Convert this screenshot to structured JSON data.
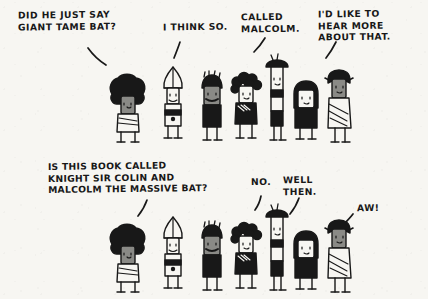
{
  "comic": {
    "title": "Knight Sir Colin and Malcolm the Massive Bat",
    "background_color": "#f7f6f2",
    "ink_color": "#181818",
    "panels": [
      {
        "id": "top-panel",
        "captions": [
          {
            "id": "caption-did-he-just-say",
            "text": "DID HE JUST SAY\nGIANT TAME BAT?",
            "x": 18,
            "y": 10
          },
          {
            "id": "caption-i-think-so",
            "text": "I THINK SO.",
            "x": 163,
            "y": 22
          },
          {
            "id": "caption-called-malcolm",
            "text": "CALLED\nMALCOLM.",
            "x": 241,
            "y": 12
          },
          {
            "id": "caption-id-like-to-hear",
            "text": "I'D LIKE TO\nHEAR MORE\nABOUT THAT.",
            "x": 318,
            "y": 9
          }
        ],
        "characters": [
          {
            "id": "character-afro",
            "name": "afro-hair-figure",
            "x": 104,
            "y": 78
          },
          {
            "id": "character-bishop",
            "name": "bishop-mitre-figure",
            "x": 155,
            "y": 72
          },
          {
            "id": "character-moustache",
            "name": "moustache-figure",
            "x": 196,
            "y": 79
          },
          {
            "id": "character-curly",
            "name": "curly-hair-figure",
            "x": 228,
            "y": 75
          },
          {
            "id": "character-tall-hat",
            "name": "tall-flat-hat-figure",
            "x": 262,
            "y": 62
          },
          {
            "id": "character-bob",
            "name": "bob-hair-figure",
            "x": 289,
            "y": 84
          },
          {
            "id": "character-toga",
            "name": "toga-robe-figure",
            "x": 322,
            "y": 72
          }
        ]
      },
      {
        "id": "bottom-panel",
        "captions": [
          {
            "id": "caption-is-this-book-called",
            "text": "IS THIS BOOK CALLED\nKNIGHT SIR COLIN AND\nMALCOLM THE MASSIVE BAT?",
            "x": 48,
            "y": 161
          },
          {
            "id": "caption-no",
            "text": "NO.",
            "x": 251,
            "y": 177
          },
          {
            "id": "caption-well-then",
            "text": "WELL\nTHEN.",
            "x": 283,
            "y": 175
          },
          {
            "id": "caption-aw",
            "text": "AW!",
            "x": 357,
            "y": 203
          }
        ],
        "characters": [
          {
            "id": "character-afro-2",
            "name": "afro-hair-figure",
            "x": 104,
            "y": 228
          },
          {
            "id": "character-bishop-2",
            "name": "bishop-mitre-figure",
            "x": 155,
            "y": 222
          },
          {
            "id": "character-moustache-2",
            "name": "moustache-figure",
            "x": 196,
            "y": 229
          },
          {
            "id": "character-curly-2",
            "name": "curly-hair-figure",
            "x": 228,
            "y": 225
          },
          {
            "id": "character-tall-hat-2",
            "name": "tall-flat-hat-figure",
            "x": 262,
            "y": 212
          },
          {
            "id": "character-bob-2",
            "name": "bob-hair-figure",
            "x": 289,
            "y": 234
          },
          {
            "id": "character-toga-2",
            "name": "toga-robe-figure",
            "x": 322,
            "y": 222
          }
        ]
      }
    ],
    "pointers": [
      {
        "id": "pointer-did-he-just-say",
        "x": 88,
        "y": 48
      },
      {
        "id": "pointer-i-think-so",
        "x": 178,
        "y": 45
      },
      {
        "id": "pointer-called-malcolm",
        "x": 260,
        "y": 42
      },
      {
        "id": "pointer-id-like-to-hear",
        "x": 330,
        "y": 44
      },
      {
        "id": "pointer-is-this-book",
        "x": 140,
        "y": 202
      },
      {
        "id": "pointer-no",
        "x": 256,
        "y": 196
      },
      {
        "id": "pointer-well-then",
        "x": 294,
        "y": 196
      },
      {
        "id": "pointer-aw",
        "x": 344,
        "y": 214
      }
    ]
  }
}
